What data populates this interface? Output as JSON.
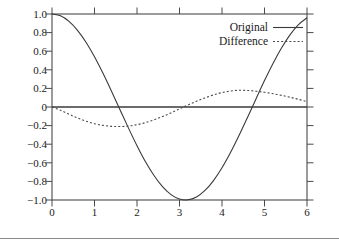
{
  "figure": {
    "background": "#ffffff",
    "frame_color": "#4a4a4a",
    "text_color": "#1a1a1a",
    "rule_color": "#8a8a8a"
  },
  "chart_data": {
    "type": "line",
    "title": "",
    "xlabel": "",
    "ylabel": "",
    "xlim": [
      0,
      6
    ],
    "ylim": [
      -1.0,
      1.0
    ],
    "grid": false,
    "zero_line": true,
    "legend_position": "upper-right-inside",
    "xticks": [
      0,
      1,
      2,
      3,
      4,
      5,
      6
    ],
    "xtick_labels": [
      "0",
      "1",
      "2",
      "3",
      "4",
      "5",
      "6"
    ],
    "yticks": [
      1.0,
      0.8,
      0.6,
      0.4,
      0.2,
      0,
      -0.2,
      -0.4,
      -0.6,
      -0.8,
      -1.0
    ],
    "ytick_labels": [
      "1.0",
      "0.8",
      "0.6",
      "0.4",
      "0.2",
      "0",
      "−0.2",
      "−0.4",
      "−0.6",
      "−0.8",
      "−1.0"
    ],
    "series": [
      {
        "name": "Original",
        "style": "solid",
        "color": "#3a3a3a",
        "x": [
          0.0,
          0.2,
          0.4,
          0.6,
          0.8,
          1.0,
          1.2,
          1.4,
          1.6,
          1.8,
          2.0,
          2.2,
          2.4,
          2.6,
          2.8,
          3.0,
          3.2,
          3.4,
          3.6,
          3.8,
          4.0,
          4.2,
          4.4,
          4.6,
          4.8,
          5.0,
          5.2,
          5.4,
          5.6,
          5.8,
          6.0
        ],
        "values": [
          1.0,
          0.98,
          0.921,
          0.825,
          0.697,
          0.54,
          0.362,
          0.17,
          -0.029,
          -0.227,
          -0.416,
          -0.589,
          -0.737,
          -0.857,
          -0.942,
          -0.99,
          -0.998,
          -0.967,
          -0.897,
          -0.791,
          -0.654,
          -0.49,
          -0.307,
          -0.112,
          0.087,
          0.284,
          0.469,
          0.635,
          0.776,
          0.886,
          0.96
        ]
      },
      {
        "name": "Difference",
        "style": "dotted",
        "color": "#4a4a4a",
        "x": [
          0.0,
          0.2,
          0.4,
          0.6,
          0.8,
          1.0,
          1.2,
          1.4,
          1.6,
          1.8,
          2.0,
          2.2,
          2.4,
          2.6,
          2.8,
          3.0,
          3.2,
          3.4,
          3.6,
          3.8,
          4.0,
          4.2,
          4.4,
          4.6,
          4.8,
          5.0,
          5.2,
          5.4,
          5.6,
          5.8,
          6.0
        ],
        "values": [
          0.0,
          -0.035,
          -0.078,
          -0.118,
          -0.152,
          -0.18,
          -0.198,
          -0.208,
          -0.21,
          -0.205,
          -0.19,
          -0.168,
          -0.138,
          -0.103,
          -0.063,
          -0.02,
          0.022,
          0.062,
          0.098,
          0.13,
          0.155,
          0.172,
          0.18,
          0.178,
          0.17,
          0.158,
          0.143,
          0.125,
          0.105,
          0.082,
          0.058
        ]
      }
    ],
    "legend": [
      {
        "label": "Original",
        "style": "solid"
      },
      {
        "label": "Difference",
        "style": "dotted"
      }
    ]
  }
}
